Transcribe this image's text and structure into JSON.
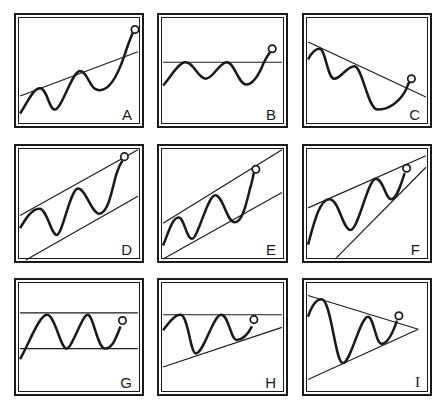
{
  "figure": {
    "colors": {
      "ink": "#1a1a1a",
      "background": "#ffffff"
    },
    "panels": [
      {
        "id": "A",
        "label": "A",
        "pattern": "rising trend line broken upward"
      },
      {
        "id": "B",
        "label": "B",
        "pattern": "horizontal resistance broken upward"
      },
      {
        "id": "C",
        "label": "C",
        "pattern": "falling trend line broken upward"
      },
      {
        "id": "D",
        "label": "D",
        "pattern": "rising parallel channel"
      },
      {
        "id": "E",
        "label": "E",
        "pattern": "rising parallel channel"
      },
      {
        "id": "F",
        "label": "F",
        "pattern": "rising wedge"
      },
      {
        "id": "G",
        "label": "G",
        "pattern": "horizontal rectangle"
      },
      {
        "id": "H",
        "label": "H",
        "pattern": "ascending triangle"
      },
      {
        "id": "I",
        "label": "I",
        "pattern": "symmetrical triangle"
      }
    ]
  }
}
